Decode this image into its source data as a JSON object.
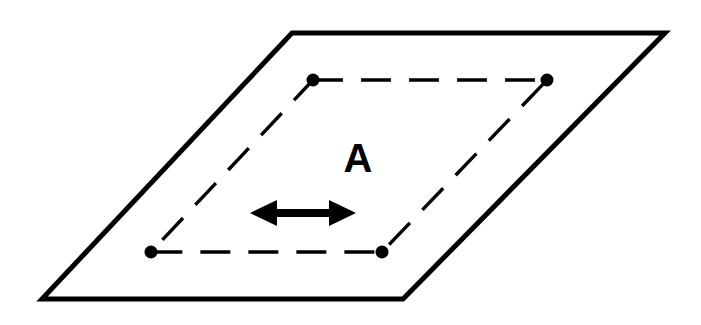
{
  "figure": {
    "name": "oriented-plane-with-dashed-loop",
    "background_color": "#ffffff",
    "ink_color": "#000000",
    "canvas": {
      "width": 701,
      "height": 325
    },
    "label": {
      "text": "A",
      "x": 358,
      "y": 172,
      "font_size": 40,
      "color": "#000000"
    },
    "plane": {
      "name": "outer-parallelogram",
      "points": "292,33 665,33 403,299 42,299",
      "stroke_width": 5,
      "stroke_color": "#000000",
      "fill": "none"
    },
    "loop": {
      "name": "inner-dashed-parallelogram",
      "points": "313,80 547,80 382,252 151,252",
      "stroke_width": 3.4,
      "stroke_color": "#000000",
      "dash_pattern": "30 18",
      "fill": "none"
    },
    "vertices": [
      {
        "name": "vertex-top-left",
        "cx": 313,
        "cy": 80,
        "r": 6.5,
        "color": "#000000"
      },
      {
        "name": "vertex-top-right",
        "cx": 547,
        "cy": 80,
        "r": 6.5,
        "color": "#000000"
      },
      {
        "name": "vertex-bottom-right",
        "cx": 382,
        "cy": 252,
        "r": 6.5,
        "color": "#000000"
      },
      {
        "name": "vertex-bottom-left",
        "cx": 151,
        "cy": 252,
        "r": 6.5,
        "color": "#000000"
      }
    ],
    "arrow": {
      "name": "double-headed-arrow",
      "orientation": "horizontal",
      "left_tip_x": 250,
      "right_tip_x": 356,
      "y": 213,
      "shaft_thickness": 8,
      "head_length": 26,
      "head_half_height": 13,
      "color": "#000000",
      "path": "250,213 277,200 277,209 329,209 329,200 356,213 329,226 329,217 277,217 277,226"
    }
  }
}
